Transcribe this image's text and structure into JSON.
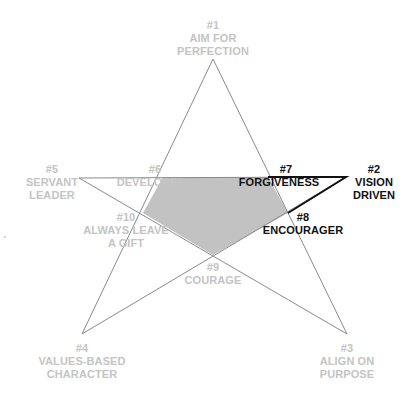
{
  "diagram": {
    "type": "star-ranking",
    "colors": {
      "star_stroke": "#8a8a8a",
      "highlight_stroke": "#111111",
      "fill_region": "#c2c2c2",
      "muted_text": "#c4c4c4",
      "strong_text": "#111111"
    },
    "points": [
      {
        "rank": "#1",
        "line1": "AIM FOR",
        "line2": "PERFECTION",
        "highlighted": false
      },
      {
        "rank": "#2",
        "line1": "VISION",
        "line2": "DRIVEN",
        "highlighted": true
      },
      {
        "rank": "#3",
        "line1": "ALIGN ON",
        "line2": "PURPOSE",
        "highlighted": false
      },
      {
        "rank": "#4",
        "line1": "VALUES-BASED",
        "line2": "CHARACTER",
        "highlighted": false
      },
      {
        "rank": "#5",
        "line1": "SERVANT",
        "line2": "LEADER",
        "highlighted": false
      }
    ],
    "inner_points": [
      {
        "rank": "#6",
        "line1": "DEVELOPER",
        "highlighted": false
      },
      {
        "rank": "#7",
        "line1": "FORGIVENESS",
        "highlighted": true
      },
      {
        "rank": "#8",
        "line1": "ENCOURAGER",
        "highlighted": true
      },
      {
        "rank": "#9",
        "line1": "COURAGE",
        "highlighted": false
      },
      {
        "rank": "#10",
        "line1": "ALWAYS LEAVE",
        "line2": "A GIFT",
        "highlighted": false
      }
    ]
  }
}
